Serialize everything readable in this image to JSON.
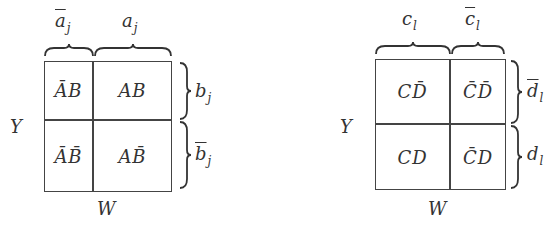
{
  "diagrams": [
    {
      "top_labels": [
        {
          "base": "a",
          "bar": true,
          "sub": "j"
        },
        {
          "base": "a",
          "bar": false,
          "sub": "j"
        }
      ],
      "right_labels": [
        {
          "base": "b",
          "bar": false,
          "sub": "j"
        },
        {
          "base": "b",
          "bar": true,
          "sub": "j"
        }
      ],
      "left_label": "Y",
      "bottom_label": "W",
      "cells": [
        [
          {
            "text": "ĀB"
          },
          {
            "text": "AB"
          }
        ],
        [
          {
            "text": "ĀB̄"
          },
          {
            "text": "AB̄"
          }
        ]
      ]
    },
    {
      "top_labels": [
        {
          "base": "c",
          "bar": false,
          "sub": "l"
        },
        {
          "base": "c",
          "bar": true,
          "sub": "l"
        }
      ],
      "right_labels": [
        {
          "base": "d",
          "bar": true,
          "sub": "l"
        },
        {
          "base": "d",
          "bar": false,
          "sub": "l"
        }
      ],
      "left_label": "Y",
      "bottom_label": "W",
      "cells": [
        [
          {
            "text": "CD̄"
          },
          {
            "text": "C̄D̄"
          }
        ],
        [
          {
            "text": "CD"
          },
          {
            "text": "C̄D"
          }
        ]
      ]
    }
  ],
  "colors": {
    "line": "#444444",
    "text": "#333333",
    "background": "#ffffff"
  }
}
